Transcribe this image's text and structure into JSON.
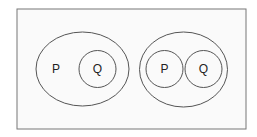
{
  "diagram": {
    "type": "venn",
    "background": "#fafafa",
    "stroke": "#555555",
    "left_group": {
      "outer_label": "P",
      "inner_label": "Q",
      "relation": "Q subset of P"
    },
    "right_group": {
      "labels": [
        "P",
        "Q"
      ],
      "relation": "P and Q disjoint, both within a universal set"
    }
  }
}
